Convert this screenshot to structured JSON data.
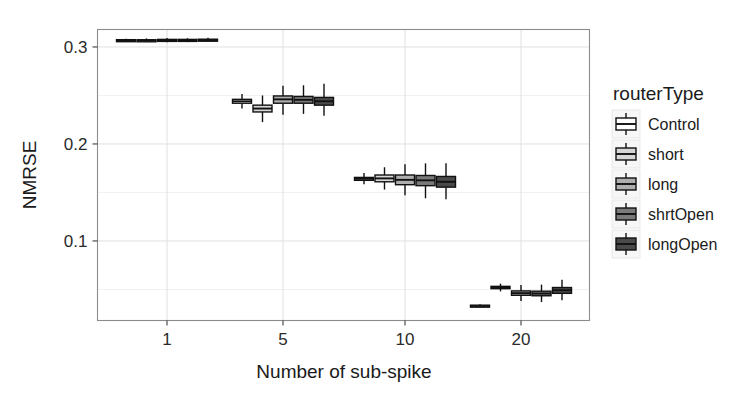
{
  "chart_data": {
    "type": "box",
    "title": "",
    "xlabel": "Number of sub-spike",
    "ylabel": "NMRSE",
    "x_categories": [
      "1",
      "5",
      "10",
      "20"
    ],
    "x_tick_labels": [
      "1",
      "5",
      "10",
      "20"
    ],
    "y_tick_labels": [
      "0.1",
      "0.2",
      "0.3"
    ],
    "y_tick_values": [
      0.1,
      0.2,
      0.3
    ],
    "ylim": [
      0.018,
      0.318
    ],
    "grid": true,
    "legend_position": "right",
    "legend_title": "routerType",
    "series": [
      {
        "name": "Control",
        "fill": "#ffffff",
        "boxes": [
          {
            "group": "1",
            "lower_whisker": 0.3055,
            "q1": 0.3065,
            "median": 0.307,
            "q3": 0.3075,
            "upper_whisker": 0.3085
          },
          {
            "group": "5",
            "lower_whisker": 0.2365,
            "q1": 0.242,
            "median": 0.244,
            "q3": 0.246,
            "upper_whisker": 0.2515
          },
          {
            "group": "10",
            "lower_whisker": 0.1585,
            "q1": 0.1625,
            "median": 0.164,
            "q3": 0.1655,
            "upper_whisker": 0.17
          },
          {
            "group": "20",
            "lower_whisker": 0.0315,
            "q1": 0.0325,
            "median": 0.033,
            "q3": 0.0338,
            "upper_whisker": 0.0348
          }
        ]
      },
      {
        "name": "short",
        "fill": "#d6d6d6",
        "boxes": [
          {
            "group": "1",
            "lower_whisker": 0.305,
            "q1": 0.3062,
            "median": 0.3068,
            "q3": 0.3074,
            "upper_whisker": 0.3088
          },
          {
            "group": "5",
            "lower_whisker": 0.2225,
            "q1": 0.233,
            "median": 0.2365,
            "q3": 0.24,
            "upper_whisker": 0.25
          },
          {
            "group": "10",
            "lower_whisker": 0.153,
            "q1": 0.161,
            "median": 0.1645,
            "q3": 0.168,
            "upper_whisker": 0.176
          },
          {
            "group": "20",
            "lower_whisker": 0.048,
            "q1": 0.0508,
            "median": 0.052,
            "q3": 0.0532,
            "upper_whisker": 0.056
          }
        ]
      },
      {
        "name": "long",
        "fill": "#aeaeae",
        "boxes": [
          {
            "group": "1",
            "lower_whisker": 0.3048,
            "q1": 0.3063,
            "median": 0.307,
            "q3": 0.3078,
            "upper_whisker": 0.3092
          },
          {
            "group": "5",
            "lower_whisker": 0.23,
            "q1": 0.242,
            "median": 0.246,
            "q3": 0.2495,
            "upper_whisker": 0.26
          },
          {
            "group": "10",
            "lower_whisker": 0.147,
            "q1": 0.158,
            "median": 0.163,
            "q3": 0.168,
            "upper_whisker": 0.179
          },
          {
            "group": "20",
            "lower_whisker": 0.038,
            "q1": 0.044,
            "median": 0.0462,
            "q3": 0.0485,
            "upper_whisker": 0.0545
          }
        ]
      },
      {
        "name": "shrtOpen",
        "fill": "#7a7a7a",
        "boxes": [
          {
            "group": "1",
            "lower_whisker": 0.305,
            "q1": 0.3064,
            "median": 0.3071,
            "q3": 0.3078,
            "upper_whisker": 0.309
          },
          {
            "group": "5",
            "lower_whisker": 0.231,
            "q1": 0.242,
            "median": 0.2455,
            "q3": 0.249,
            "upper_whisker": 0.2605
          },
          {
            "group": "10",
            "lower_whisker": 0.144,
            "q1": 0.157,
            "median": 0.1625,
            "q3": 0.1675,
            "upper_whisker": 0.18
          },
          {
            "group": "20",
            "lower_whisker": 0.037,
            "q1": 0.0435,
            "median": 0.0458,
            "q3": 0.0482,
            "upper_whisker": 0.055
          }
        ]
      },
      {
        "name": "longOpen",
        "fill": "#4a4a4a",
        "boxes": [
          {
            "group": "1",
            "lower_whisker": 0.3052,
            "q1": 0.3065,
            "median": 0.3072,
            "q3": 0.308,
            "upper_whisker": 0.3095
          },
          {
            "group": "5",
            "lower_whisker": 0.229,
            "q1": 0.24,
            "median": 0.244,
            "q3": 0.248,
            "upper_whisker": 0.262
          },
          {
            "group": "10",
            "lower_whisker": 0.143,
            "q1": 0.1555,
            "median": 0.161,
            "q3": 0.1665,
            "upper_whisker": 0.18
          },
          {
            "group": "20",
            "lower_whisker": 0.039,
            "q1": 0.046,
            "median": 0.0492,
            "q3": 0.052,
            "upper_whisker": 0.06
          }
        ]
      }
    ]
  },
  "legend": {
    "title": "routerType",
    "items": [
      {
        "label": "Control",
        "fill": "#ffffff"
      },
      {
        "label": "short",
        "fill": "#d6d6d6"
      },
      {
        "label": "long",
        "fill": "#aeaeae"
      },
      {
        "label": "shrtOpen",
        "fill": "#7a7a7a"
      },
      {
        "label": "longOpen",
        "fill": "#4a4a4a"
      }
    ]
  },
  "axes": {
    "x_title": "Number of sub-spike",
    "y_title": "NMRSE",
    "x_ticks": [
      "1",
      "5",
      "10",
      "20"
    ],
    "y_ticks": [
      "0.1",
      "0.2",
      "0.3"
    ]
  },
  "style": {
    "panel_border_color": "#8c8c8c",
    "grid_major_color": "#e0e0e0",
    "grid_minor_color": "#efefef",
    "box_outline_color": "#111111",
    "background": "#ffffff"
  }
}
